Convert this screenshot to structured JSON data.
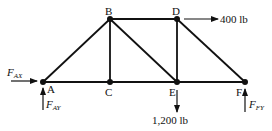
{
  "diagram": {
    "type": "truss",
    "nodes": [
      {
        "id": "A",
        "label": "A",
        "x": 43,
        "y": 82
      },
      {
        "id": "B",
        "label": "B",
        "x": 110,
        "y": 19
      },
      {
        "id": "C",
        "label": "C",
        "x": 110,
        "y": 82
      },
      {
        "id": "D",
        "label": "D",
        "x": 177,
        "y": 19
      },
      {
        "id": "E",
        "label": "E",
        "x": 177,
        "y": 82
      },
      {
        "id": "F",
        "label": "F",
        "x": 245,
        "y": 82
      }
    ],
    "members": [
      [
        "A",
        "B"
      ],
      [
        "A",
        "C"
      ],
      [
        "C",
        "E"
      ],
      [
        "E",
        "F"
      ],
      [
        "B",
        "C"
      ],
      [
        "B",
        "D"
      ],
      [
        "B",
        "E"
      ],
      [
        "D",
        "E"
      ],
      [
        "D",
        "F"
      ]
    ],
    "loads": [
      {
        "at": "D",
        "direction": "right",
        "label": "400 lb"
      },
      {
        "at": "E",
        "direction": "down",
        "label": "1,200 lb"
      }
    ],
    "reactions": [
      {
        "at": "A",
        "direction": "right",
        "main": "F",
        "sub": "AX"
      },
      {
        "at": "A",
        "direction": "up",
        "main": "F",
        "sub": "AY"
      },
      {
        "at": "F",
        "direction": "up",
        "main": "F",
        "sub": "FY"
      }
    ]
  }
}
